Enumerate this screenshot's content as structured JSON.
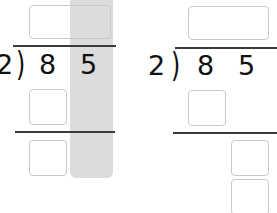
{
  "problems": [
    {
      "divisor": "2",
      "dividend_digits": [
        "8",
        "5"
      ],
      "paren": ")",
      "highlighted_column": "ones",
      "highlight_color": "#dcdcdc"
    },
    {
      "divisor": "2",
      "dividend_digits": [
        "8",
        "5"
      ],
      "paren": ")"
    }
  ]
}
